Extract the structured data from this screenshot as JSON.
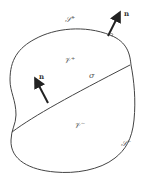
{
  "diagram": {
    "labels": {
      "surface_plus": "𝒮⁺",
      "surface_minus": "𝒮⁻",
      "volume_plus": "𝒱⁺",
      "volume_minus": "𝒱⁻",
      "interface": "σ",
      "normal_outer": "n",
      "normal_interface": "n"
    },
    "colors": {
      "stroke": "#333333",
      "label": "#555555"
    }
  }
}
